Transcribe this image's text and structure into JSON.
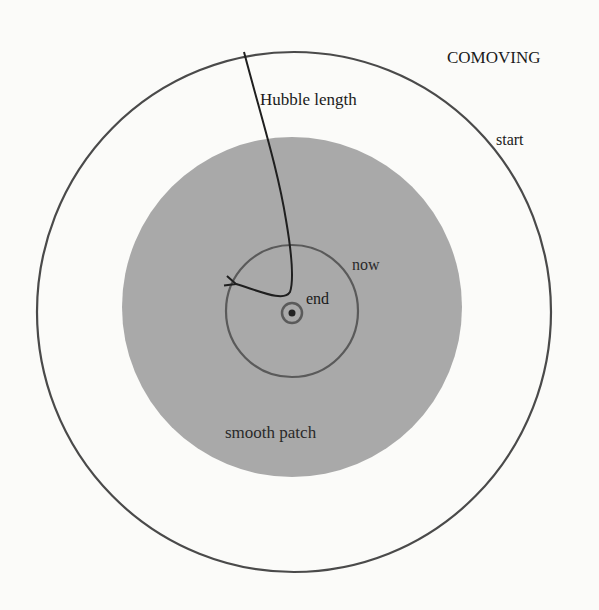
{
  "diagram": {
    "title": "COMOVING",
    "labels": {
      "hubble_length": "Hubble length",
      "start": "start",
      "now": "now",
      "end": "end",
      "smooth_patch": "smooth patch"
    },
    "colors": {
      "background": "#fbfbf9",
      "line": "#3a3a3a",
      "smooth_patch_fill": "#a9a9a9",
      "text": "#1a1a1a"
    },
    "shapes": {
      "outer_circle_start": {
        "cx": 294,
        "cy": 312,
        "rx": 257,
        "ry": 260
      },
      "smooth_patch_disc": {
        "cx": 292,
        "cy": 307,
        "r": 170
      },
      "now_circle": {
        "cx": 292,
        "cy": 311,
        "r": 66
      },
      "end_circle": {
        "cx": 292,
        "cy": 313,
        "r": 11
      },
      "end_dot": {
        "cx": 292,
        "cy": 313,
        "r": 3.5
      }
    }
  }
}
